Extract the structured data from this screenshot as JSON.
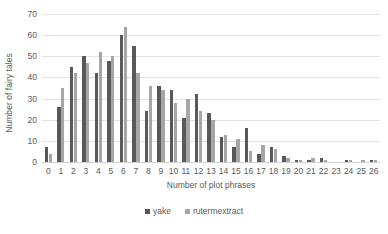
{
  "chart_data": {
    "type": "bar",
    "title": "",
    "xlabel": "Number of plot phrases",
    "ylabel": "Number of fairy tales",
    "categories": [
      "0",
      "1",
      "2",
      "3",
      "4",
      "5",
      "6",
      "7",
      "8",
      "9",
      "10",
      "11",
      "12",
      "13",
      "14",
      "15",
      "16",
      "17",
      "18",
      "19",
      "20",
      "21",
      "22",
      "23",
      "24",
      "25",
      "26"
    ],
    "series": [
      {
        "name": "yake",
        "color": "#595959",
        "values": [
          7,
          26,
          45,
          50,
          42,
          48,
          60,
          55,
          24,
          36,
          34,
          21,
          32,
          23,
          12,
          7,
          16,
          4,
          7,
          3,
          1,
          1,
          2,
          0,
          1,
          0,
          1
        ]
      },
      {
        "name": "rutermextract",
        "color": "#a6a6a6",
        "values": [
          4,
          35,
          42,
          47,
          52,
          50,
          64,
          42,
          36,
          34,
          28,
          30,
          24,
          20,
          13,
          11,
          5,
          8,
          6,
          2,
          1,
          2,
          1,
          0,
          1,
          1,
          1
        ]
      }
    ],
    "ylim": [
      0,
      70
    ],
    "yticks": [
      0,
      10,
      20,
      30,
      40,
      50,
      60,
      70
    ],
    "grid": true,
    "legend_position": "bottom"
  },
  "legend": {
    "items": [
      {
        "label": "yake"
      },
      {
        "label": "rutermextract"
      }
    ]
  }
}
